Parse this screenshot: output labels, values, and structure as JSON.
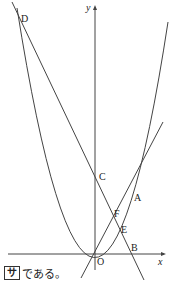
{
  "figure": {
    "axis_labels": {
      "x": "x",
      "y": "y"
    },
    "points": {
      "O": "O",
      "A": "A",
      "B": "B",
      "C": "C",
      "D": "D",
      "E": "E",
      "F": "F"
    },
    "colors": {
      "stroke": "#444444",
      "text": "#222222"
    }
  },
  "caption": {
    "answer_box": "サ",
    "text": "である。"
  }
}
